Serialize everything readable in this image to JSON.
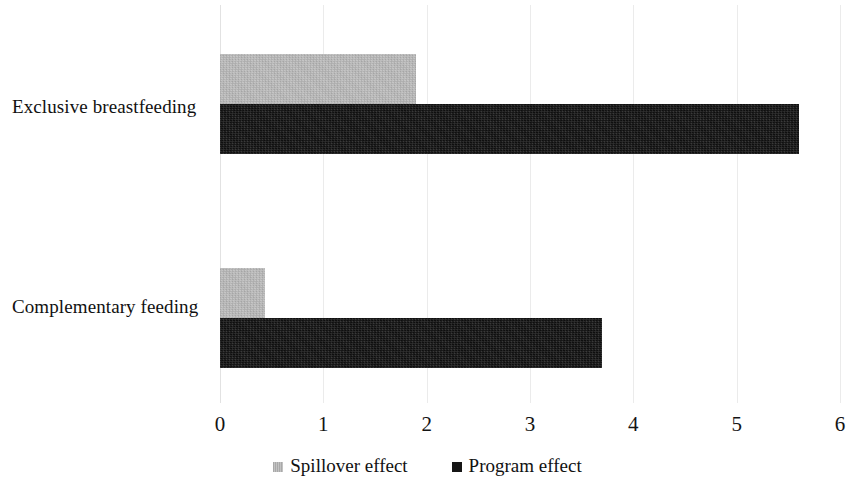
{
  "chart_data": {
    "type": "bar",
    "orientation": "horizontal",
    "title": "",
    "subtitle": "",
    "xlabel": "",
    "ylabel": "",
    "categories": [
      "Exclusive breastfeeding",
      "Complementary feeding"
    ],
    "series": [
      {
        "name": "Spillover effect",
        "color": "#bcbcbc",
        "values": [
          1.9,
          0.44
        ]
      },
      {
        "name": "Program effect",
        "color": "#1b1b1b",
        "values": [
          5.6,
          3.7
        ]
      }
    ],
    "xlim": [
      0,
      6
    ],
    "xticks": [
      0,
      1,
      2,
      3,
      4,
      5,
      6
    ],
    "xtick_labels": [
      "0",
      "1",
      "2",
      "3",
      "4",
      "5",
      "6"
    ],
    "grid": true,
    "grid_axis": "x",
    "legend_position": "bottom"
  },
  "axis": {
    "ticks": [
      {
        "label": "0",
        "value": 0
      },
      {
        "label": "1",
        "value": 1
      },
      {
        "label": "2",
        "value": 2
      },
      {
        "label": "3",
        "value": 3
      },
      {
        "label": "4",
        "value": 4
      },
      {
        "label": "5",
        "value": 5
      },
      {
        "label": "6",
        "value": 6
      }
    ]
  },
  "categories": [
    {
      "label": "Exclusive breastfeeding"
    },
    {
      "label": "Complementary feeding"
    }
  ],
  "legend": {
    "items": [
      {
        "label": "Spillover effect",
        "swatch": "spillover"
      },
      {
        "label": "Program effect",
        "swatch": "program"
      }
    ]
  },
  "colors": {
    "spillover": "#bcbcbc",
    "program": "#1b1b1b",
    "gridline": "#ebebeb",
    "text": "#111111",
    "background": "#ffffff"
  }
}
